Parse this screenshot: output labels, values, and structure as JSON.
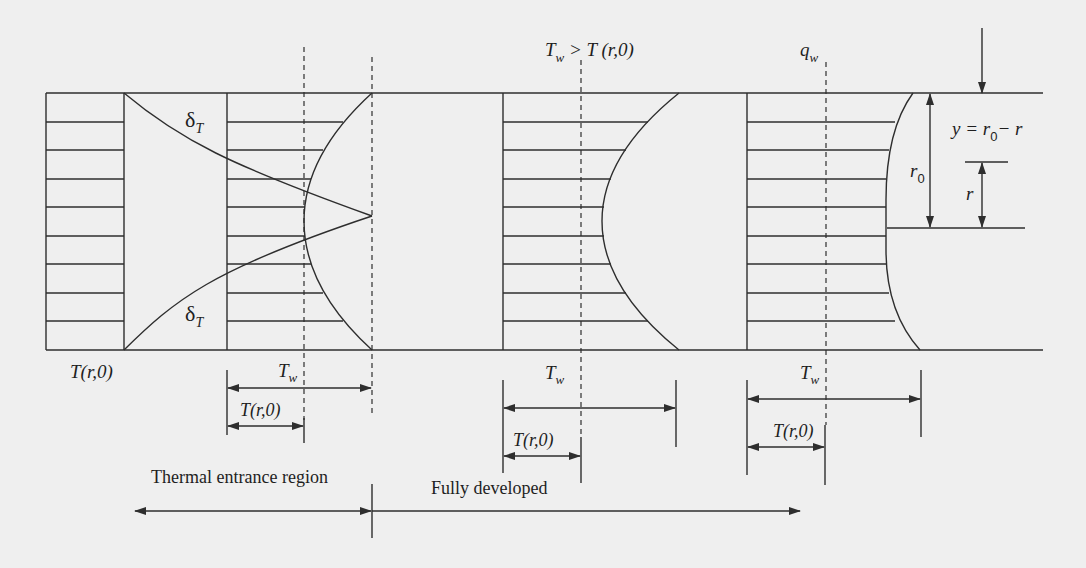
{
  "diagram": {
    "colors": {
      "background": "#efefef",
      "line": "#2e2e2e",
      "text": "#1e1e1e"
    },
    "labels": {
      "inlet_temperature": "T(r,0)",
      "delta_t_upper": "δ",
      "delta_t_upper_sub": "T",
      "delta_t_lower": "δ",
      "delta_t_lower_sub": "T",
      "condition_T": "T",
      "condition_sub": "w",
      "condition_rest": " > T (r,0)",
      "heat_flux": "q",
      "heat_flux_sub": "w",
      "coord_y": "y = r",
      "coord_y_sub": "0",
      "coord_y_rest": "− r",
      "radius_r0": "r",
      "radius_r0_sub": "0",
      "radius_r": "r"
    },
    "dimensions": [
      {
        "id": "entrance",
        "wall_T": "T",
        "wall_sub": "w",
        "inlet": "T(r,0)"
      },
      {
        "id": "developed-constant-Tw",
        "wall_T": "T",
        "wall_sub": "w",
        "inlet": "T(r,0)"
      },
      {
        "id": "developed-constant-qw",
        "wall_T": "T",
        "wall_sub": "w",
        "inlet": "T(r,0)"
      }
    ],
    "regions": {
      "entrance": "Thermal entrance region",
      "developed": "Fully developed"
    }
  }
}
